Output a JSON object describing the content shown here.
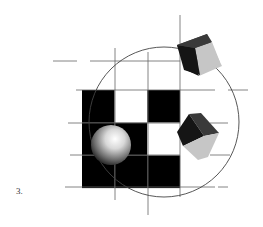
{
  "figure": {
    "label": "3.",
    "grid": {
      "rows": 3,
      "cols": 3,
      "cells": [
        [
          "black",
          "white",
          "black"
        ],
        [
          "black",
          "black",
          "white"
        ],
        [
          "black",
          "black",
          "black"
        ]
      ]
    },
    "objects": [
      {
        "type": "sphere",
        "row": 1,
        "col": 0
      },
      {
        "type": "cube",
        "position": "top-right"
      },
      {
        "type": "cube",
        "position": "right"
      }
    ],
    "colors": {
      "black": "#000000",
      "white": "#ffffff",
      "line": "#555555",
      "cube_dark": "#1a1a1a",
      "cube_mid": "#444444",
      "cube_light": "#c4c4c4"
    }
  }
}
